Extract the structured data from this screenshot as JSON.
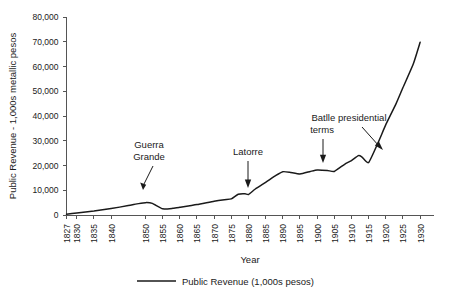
{
  "chart_data": {
    "type": "line",
    "title": "",
    "xlabel": "Year",
    "ylabel": "Public Revenue - 1,000s metallic pesos",
    "xlim": [
      1827,
      1932
    ],
    "ylim": [
      0,
      80000
    ],
    "grid": false,
    "legend_position": "bottom-center",
    "ytick_labels": [
      "0",
      "10,000",
      "20,000",
      "30,000",
      "40,000",
      "50,000",
      "60,000",
      "70,000",
      "80,000"
    ],
    "ytick_values": [
      0,
      10000,
      20000,
      30000,
      40000,
      50000,
      60000,
      70000,
      80000
    ],
    "xtick_labels": [
      "1827",
      "1830",
      "1835",
      "1840",
      "1850",
      "1855",
      "1860",
      "1865",
      "1870",
      "1875",
      "1880",
      "1885",
      "1890",
      "1895",
      "1900",
      "1905",
      "1910",
      "1915",
      "1920",
      "1925",
      "1930"
    ],
    "xtick_values": [
      1827,
      1830,
      1835,
      1840,
      1850,
      1855,
      1860,
      1865,
      1870,
      1875,
      1880,
      1885,
      1890,
      1895,
      1900,
      1905,
      1910,
      1915,
      1920,
      1925,
      1930
    ],
    "series": [
      {
        "name": "Public Revenue (1,000s pesos)",
        "color": "#1a1a1a",
        "x": [
          1827,
          1830,
          1835,
          1840,
          1845,
          1848,
          1850,
          1852,
          1855,
          1858,
          1860,
          1865,
          1870,
          1873,
          1875,
          1877,
          1879,
          1880,
          1882,
          1885,
          1888,
          1890,
          1892,
          1895,
          1898,
          1900,
          1903,
          1905,
          1908,
          1910,
          1912,
          1913,
          1915,
          1918,
          1920,
          1923,
          1925,
          1928,
          1930
        ],
        "values": [
          300,
          800,
          1600,
          2600,
          3800,
          4600,
          5000,
          4700,
          2500,
          2700,
          3100,
          4200,
          5600,
          6200,
          6500,
          8400,
          8600,
          8300,
          10500,
          13200,
          16000,
          17500,
          17300,
          16600,
          17600,
          18200,
          18000,
          17600,
          20500,
          22000,
          24000,
          23500,
          21200,
          30000,
          36500,
          45000,
          51500,
          61000,
          69800
        ]
      }
    ],
    "legend": [
      {
        "label": "Public Revenue (1,000s pesos)",
        "color": "#1a1a1a"
      }
    ],
    "annotations": [
      {
        "id": "guerra-grande",
        "text_line1": "Guerra",
        "text_line2": "Grande",
        "points_to_year": 1852,
        "points_to_value": 4700
      },
      {
        "id": "latorre",
        "text_line1": "Latorre",
        "text_line2": "",
        "points_to_year": 1878,
        "points_to_value": 8500
      },
      {
        "id": "batlle",
        "text_line1": "Batlle presidential",
        "text_line2": "terms",
        "points_to_year_a": 1903,
        "points_to_value_a": 18000,
        "points_to_year_b": 1912,
        "points_to_value_b": 24000
      }
    ]
  },
  "figure": {
    "background_color": "#ffffff",
    "axis_color": "#555555",
    "text_color": "#1a1a1a"
  }
}
